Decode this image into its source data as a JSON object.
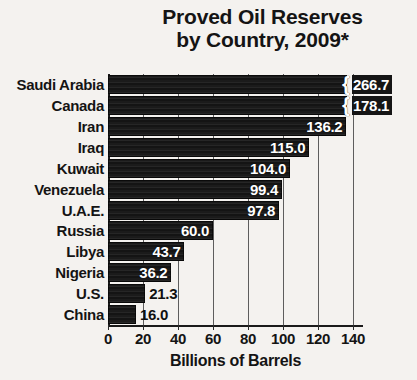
{
  "chart_data": {
    "type": "bar",
    "orientation": "horizontal",
    "title": "Proved Oil Reserves\nby Country, 2009*",
    "title_line1": "Proved Oil Reserves",
    "title_line2": "by Country, 2009*",
    "xlabel": "Billions of Barrels",
    "ylabel": "",
    "xlim": [
      0,
      140
    ],
    "xticks": [
      0,
      20,
      40,
      60,
      80,
      100,
      120,
      140
    ],
    "xtick_labels": [
      "0",
      "20",
      "40",
      "60",
      "80",
      "100",
      "120",
      "140"
    ],
    "grid": "vertical",
    "legend": "none",
    "note": "Bars for Saudi Arabia and Canada are truncated with an axis-break symbol because their values exceed the 140 axis maximum.",
    "categories": [
      "Saudi Arabia",
      "Canada",
      "Iran",
      "Iraq",
      "Kuwait",
      "Venezuela",
      "U.A.E.",
      "Russia",
      "Libya",
      "Nigeria",
      "U.S.",
      "China"
    ],
    "values": [
      266.7,
      178.1,
      136.2,
      115.0,
      104.0,
      99.4,
      97.8,
      60.0,
      43.7,
      36.2,
      21.3,
      16.0
    ],
    "value_labels": [
      "266.7",
      "178.1",
      "136.2",
      "115.0",
      "104.0",
      "99.4",
      "97.8",
      "60.0",
      "43.7",
      "36.2",
      "21.3",
      "16.0"
    ],
    "truncated": [
      true,
      true,
      false,
      false,
      false,
      false,
      false,
      false,
      false,
      false,
      false,
      false
    ],
    "label_placement": [
      "outside",
      "outside",
      "inside",
      "inside",
      "inside",
      "inside",
      "inside",
      "inside",
      "inside",
      "inside",
      "outside",
      "outside"
    ],
    "colors": {
      "bar": "#191919",
      "background": "#f4f2ef",
      "text": "#141414",
      "value_text_inside": "#ffffff",
      "gridline": "#5d5d5d",
      "axis": "#1a1a1a"
    }
  }
}
